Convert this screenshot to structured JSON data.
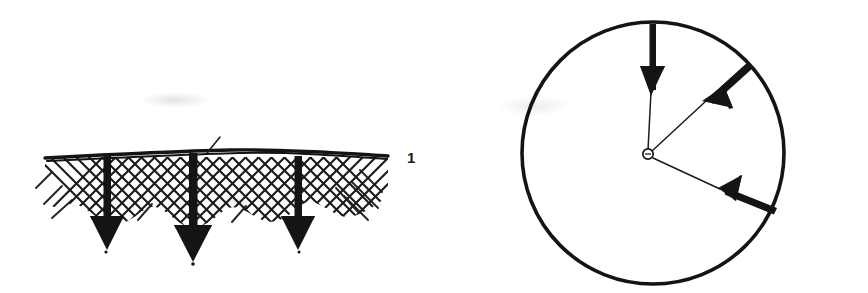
{
  "page": {
    "width": 868,
    "height": 293,
    "background_color": "#ffffff",
    "ink_color": "#141414"
  },
  "figures": [
    {
      "id": "figure-1",
      "label": "1",
      "label_position": {
        "x": 407,
        "y": 150
      },
      "caption": "",
      "type": "hatched-surface-with-downward-load-arrows",
      "surface": {
        "name": "ground-surface-line",
        "x_start": 45,
        "x_end": 388,
        "y": 157,
        "stroke_width": 3.2
      },
      "hatching": {
        "name": "cross-hatch-region",
        "style": "double-diagonal-crosshatch",
        "direction_degrees": [
          45,
          -45
        ],
        "spacing": 13,
        "stroke_width": 2.0,
        "depth": 60,
        "wavy_bottom": true
      },
      "arrows": [
        {
          "name": "load-arrow-left",
          "x": 107,
          "y_start": 157,
          "y_end": 250,
          "shaft_width": 7,
          "head_width": 34,
          "head_length": 30,
          "direction": "down"
        },
        {
          "name": "load-arrow-center",
          "x": 193,
          "y_start": 157,
          "y_end": 262,
          "shaft_width": 8,
          "head_width": 38,
          "head_length": 33,
          "direction": "down"
        },
        {
          "name": "load-arrow-right",
          "x": 298,
          "y_start": 157,
          "y_end": 250,
          "shaft_width": 7,
          "head_width": 34,
          "head_length": 30,
          "direction": "down"
        }
      ],
      "tick_mark": {
        "name": "surface-tick-mark",
        "x1": 207,
        "y1": 152,
        "x2": 219,
        "y2": 138
      }
    },
    {
      "id": "figure-2",
      "label": "2",
      "label_position": {
        "x": 813,
        "y": 155
      },
      "caption": "",
      "type": "circle-with-radial-load-arrows",
      "circle": {
        "name": "outer-circle",
        "center_x": 653,
        "center_y": 153,
        "radius": 131,
        "stroke_width": 3.4
      },
      "hub": {
        "name": "center-hub",
        "center_x": 648,
        "center_y": 154,
        "radius": 5,
        "stroke_width": 1.6,
        "filled": false
      },
      "arrows": [
        {
          "name": "radial-arrow-top",
          "angle_degrees": 90,
          "tail_x": 653,
          "tail_y": 24,
          "head_tip_x": 650,
          "head_tip_y": 92,
          "thin_tail_to_center": true,
          "shaft_width": 6,
          "head_width": 20,
          "head_length": 26
        },
        {
          "name": "radial-arrow-upper-right",
          "angle_degrees": 40,
          "tail_x": 751,
          "tail_y": 64,
          "head_tip_x": 704,
          "head_tip_y": 100,
          "thin_tail_to_center": true,
          "shaft_width": 6,
          "head_width": 20,
          "head_length": 26
        },
        {
          "name": "radial-arrow-lower-right",
          "angle_degrees": -21,
          "tail_x": 775,
          "tail_y": 212,
          "head_tip_x": 718,
          "head_tip_y": 188,
          "thin_tail_to_center": true,
          "shaft_width": 6,
          "head_width": 20,
          "head_length": 26
        }
      ]
    }
  ]
}
